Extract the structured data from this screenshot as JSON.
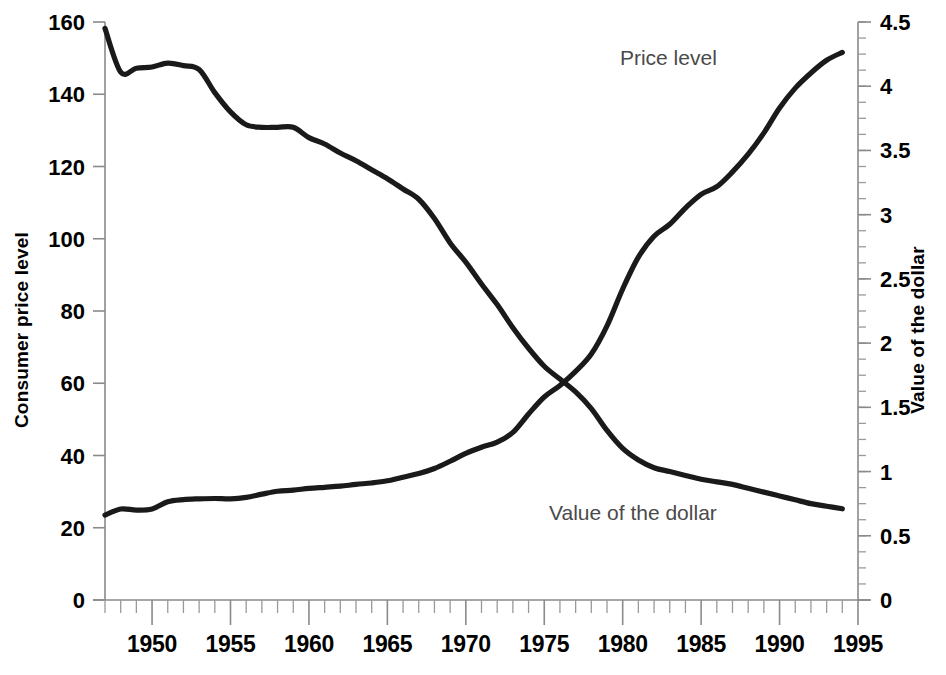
{
  "chart_data": {
    "type": "line",
    "title": "",
    "xlabel": "",
    "ylabel": "Consumer price level",
    "y2label": "Value of the dollar",
    "xlim": [
      1947,
      1995
    ],
    "ylim": [
      0,
      160
    ],
    "y2lim": [
      0,
      4.5
    ],
    "grid": false,
    "legend_position": "inline-annotation",
    "x_tick_labels": [
      "1950",
      "1955",
      "1960",
      "1965",
      "1970",
      "1975",
      "1980",
      "1985",
      "1990",
      "1995"
    ],
    "x_tick_values": [
      1950,
      1955,
      1960,
      1965,
      1970,
      1975,
      1980,
      1985,
      1990,
      1995
    ],
    "x_minor_tick_interval": 1,
    "y_tick_labels": [
      "0",
      "20",
      "40",
      "60",
      "80",
      "100",
      "120",
      "140",
      "160"
    ],
    "y_tick_values": [
      0,
      20,
      40,
      60,
      80,
      100,
      120,
      140,
      160
    ],
    "y2_tick_labels": [
      "0",
      "0.5",
      "1",
      "1.5",
      "2",
      "2.5",
      "3",
      "3.5",
      "4",
      "4.5"
    ],
    "y2_tick_values": [
      0,
      0.5,
      1,
      1.5,
      2,
      2.5,
      3,
      3.5,
      4,
      4.5
    ],
    "y2_minor_tick_interval": 0.125,
    "x": [
      1947,
      1948,
      1949,
      1950,
      1951,
      1952,
      1953,
      1954,
      1955,
      1956,
      1957,
      1958,
      1959,
      1960,
      1961,
      1962,
      1963,
      1964,
      1965,
      1966,
      1967,
      1968,
      1969,
      1970,
      1971,
      1972,
      1973,
      1974,
      1975,
      1976,
      1977,
      1978,
      1979,
      1980,
      1981,
      1982,
      1983,
      1984,
      1985,
      1986,
      1987,
      1988,
      1989,
      1990,
      1991,
      1992,
      1993,
      1994
    ],
    "series": [
      {
        "name": "Price level",
        "axis": "left",
        "units": "Consumer price level (index)",
        "color": "#1a1a1a",
        "label_position": {
          "x": 1986,
          "y": 148
        },
        "values": [
          23.5,
          25.2,
          24.9,
          25.2,
          27.2,
          27.8,
          28.0,
          28.1,
          28.0,
          28.4,
          29.3,
          30.1,
          30.4,
          30.9,
          31.2,
          31.5,
          32.0,
          32.4,
          33.0,
          34.0,
          35.0,
          36.4,
          38.4,
          40.6,
          42.3,
          43.7,
          46.4,
          51.5,
          56.2,
          59.4,
          63.3,
          68.1,
          75.9,
          86.1,
          94.9,
          100.7,
          104.0,
          108.5,
          112.3,
          114.4,
          118.5,
          123.4,
          129.3,
          136.2,
          141.7,
          145.9,
          149.4,
          151.6
        ]
      },
      {
        "name": "Value of the dollar",
        "axis": "right",
        "units": "Value of the dollar (1982-84 = $1)",
        "color": "#1a1a1a",
        "label_position": {
          "x": 1986,
          "y": 0.62
        },
        "values": [
          4.45,
          4.11,
          4.14,
          4.15,
          4.18,
          4.16,
          4.13,
          3.95,
          3.8,
          3.7,
          3.68,
          3.68,
          3.68,
          3.6,
          3.55,
          3.48,
          3.42,
          3.35,
          3.28,
          3.2,
          3.12,
          2.97,
          2.78,
          2.63,
          2.46,
          2.3,
          2.12,
          1.96,
          1.82,
          1.72,
          1.62,
          1.49,
          1.32,
          1.18,
          1.09,
          1.03,
          1.0,
          0.97,
          0.94,
          0.92,
          0.9,
          0.87,
          0.84,
          0.81,
          0.78,
          0.75,
          0.73,
          0.71
        ]
      }
    ]
  },
  "annotations": {
    "price_level_label": "Price level",
    "dollar_value_label": "Value of the dollar"
  },
  "axes": {
    "left_title": "Consumer price level",
    "right_title": "Value of the dollar"
  }
}
